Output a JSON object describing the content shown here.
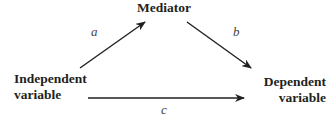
{
  "nodes": {
    "mediator": "Mediator",
    "independent_line1": "Independent",
    "independent_line2": "variable",
    "dependent_line1": "Dependent",
    "dependent_line2": "variable"
  },
  "paths": {
    "a": "a",
    "b": "b",
    "c": "c"
  },
  "colors": {
    "ink": "#231f20"
  }
}
